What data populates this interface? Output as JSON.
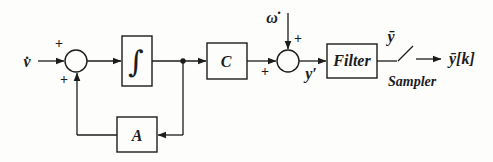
{
  "diagram": {
    "colors": {
      "line": "#1c1c1c",
      "background": "#fdfdfb"
    },
    "labels": {
      "input": "v̇",
      "disturbance": "ω̇",
      "integrator": "∫",
      "gain_c": "C",
      "gain_a": "A",
      "filter": "Filter",
      "sampler": "Sampler",
      "summed_output": "y′",
      "filter_output": "ȳ",
      "sampled_output": "ȳ[k]"
    },
    "signs": {
      "sum1_input": "+",
      "sum1_feedback": "+",
      "sum2_input": "+",
      "sum2_disturbance": "+"
    }
  }
}
